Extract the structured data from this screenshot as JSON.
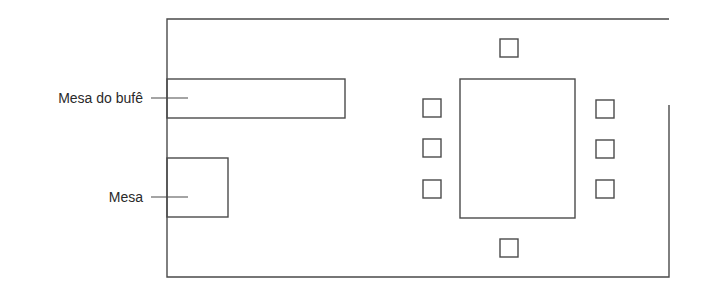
{
  "diagram": {
    "title": "",
    "type": "floor-plan",
    "stroke_color": "#4a4a4a",
    "background": "#ffffff",
    "labels": [
      {
        "id": "buffet",
        "text": "Mesa do bufê"
      },
      {
        "id": "table",
        "text": "Mesa"
      }
    ],
    "room": {
      "walls": "outer rectangle with opening on upper-right side"
    },
    "furniture": {
      "buffet_table": {
        "label": "Mesa do bufê"
      },
      "side_table": {
        "label": "Mesa"
      },
      "dining_table": {
        "chairs": 8
      }
    }
  }
}
